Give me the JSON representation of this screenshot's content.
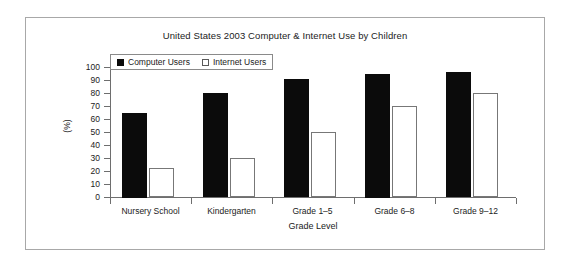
{
  "chart_data": {
    "type": "bar",
    "title": "United States 2003 Computer & Internet Use by Children",
    "xlabel": "Grade Level",
    "ylabel": "(%)",
    "categories": [
      "Nursery School",
      "Kindergarten",
      "Grade 1–5",
      "Grade 6–8",
      "Grade 9–12"
    ],
    "series": [
      {
        "name": "Computer Users",
        "color": "#0b0b0b",
        "fill": "solid",
        "values": [
          65,
          80,
          91,
          95,
          96
        ]
      },
      {
        "name": "Internet Users",
        "color": "#ffffff",
        "fill": "open",
        "values": [
          22,
          30,
          50,
          70,
          80
        ]
      }
    ],
    "ylim": [
      0,
      100
    ],
    "yticks": [
      0,
      10,
      20,
      30,
      40,
      50,
      60,
      70,
      80,
      90,
      100
    ],
    "ytick_labels": [
      "0",
      "10",
      "20",
      "30",
      "40",
      "50",
      "60",
      "70",
      "80",
      "90",
      "100"
    ],
    "grid": false,
    "legend_position": "top-left"
  }
}
